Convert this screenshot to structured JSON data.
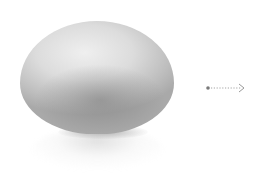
{
  "scene": {
    "subject": "egg",
    "background_color": "#ffffff",
    "egg_color": "#c8c8c8",
    "reflection": true
  },
  "indicator": {
    "icon": "dotted-arrow-right-icon",
    "color": "#8a8a8a"
  }
}
